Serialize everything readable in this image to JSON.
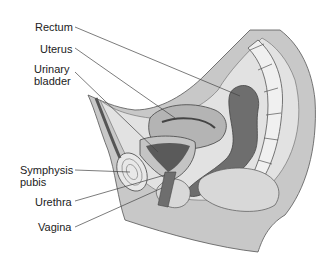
{
  "diagram": {
    "labels": [
      {
        "id": "rectum",
        "text": "Rectum"
      },
      {
        "id": "uterus",
        "text": "Uterus"
      },
      {
        "id": "urinary-bladder-1",
        "text": "Urinary"
      },
      {
        "id": "urinary-bladder-2",
        "text": "bladder"
      },
      {
        "id": "symphysis-pubis-1",
        "text": "Symphysis"
      },
      {
        "id": "symphysis-pubis-2",
        "text": "pubis"
      },
      {
        "id": "urethra",
        "text": "Urethra"
      },
      {
        "id": "vagina",
        "text": "Vagina"
      }
    ],
    "colors": {
      "skin": "#c8c8c8",
      "light_tissue": "#e2e2e2",
      "mid_tissue": "#b4b4b4",
      "dark_organ": "#6e6e6e",
      "bone": "#f0f0f0",
      "outline": "#555555",
      "leader": "#444444"
    }
  }
}
